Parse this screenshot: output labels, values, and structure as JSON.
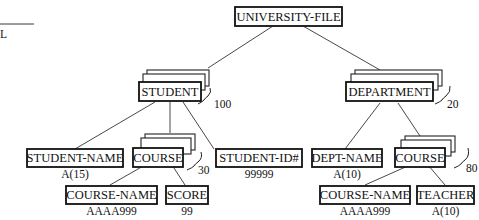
{
  "margin_fragment": {
    "text": "L"
  },
  "root": {
    "label": "UNIVERSITY-FILE"
  },
  "segments": {
    "student": {
      "label": "STUDENT",
      "count": "100"
    },
    "department": {
      "label": "DEPARTMENT",
      "count": "20"
    },
    "student_course": {
      "label": "COURSE",
      "count": "30"
    },
    "dept_course": {
      "label": "COURSE",
      "count": "80"
    }
  },
  "fields": {
    "student_name": {
      "label": "STUDENT-NAME",
      "format": "A(15)"
    },
    "student_id": {
      "label": "STUDENT-ID#",
      "format": "99999"
    },
    "student_course_name": {
      "label": "COURSE-NAME",
      "format": "AAAA999"
    },
    "score": {
      "label": "SCORE",
      "format": "99"
    },
    "dept_name": {
      "label": "DEPT-NAME",
      "format": "A(10)"
    },
    "dept_course_name": {
      "label": "COURSE-NAME",
      "format": "AAAA999"
    },
    "teacher": {
      "label": "TEACHER",
      "format": "A(10)"
    }
  }
}
